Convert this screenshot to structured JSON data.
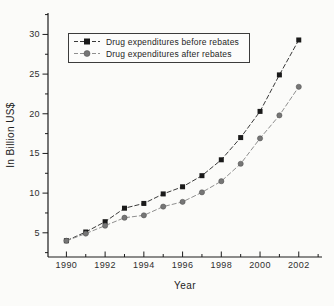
{
  "figure": {
    "background_color": "#fbfbf9",
    "axis_color": "#1c1c1c",
    "text_color": "#2e2e2e"
  },
  "chart_data": {
    "type": "line",
    "title": "",
    "xlabel": "Year",
    "ylabel": "In Billion US$",
    "x": [
      1990,
      1991,
      1992,
      1993,
      1994,
      1995,
      1996,
      1997,
      1998,
      1999,
      2000,
      2001,
      2002
    ],
    "series": [
      {
        "name": "Drug expenditures before rebates",
        "marker": "square",
        "marker_color": "#1a1a1a",
        "line_color": "#3a3a3a",
        "values": [
          4.0,
          5.1,
          6.4,
          8.1,
          8.7,
          9.9,
          10.8,
          12.2,
          14.2,
          17.0,
          20.3,
          24.9,
          29.3
        ]
      },
      {
        "name": "Drug expenditures after rebates",
        "marker": "circle",
        "marker_color": "#767676",
        "line_color": "#8f8f8f",
        "values": [
          4.0,
          4.9,
          5.9,
          6.9,
          7.2,
          8.3,
          8.9,
          10.1,
          11.5,
          13.7,
          16.9,
          19.8,
          23.4
        ]
      }
    ],
    "xlim": [
      1989.05,
      2003.2
    ],
    "ylim": [
      1.95,
      32.7
    ],
    "x_major_ticks": [
      1990,
      1992,
      1994,
      1996,
      1998,
      2000,
      2002
    ],
    "x_minor_ticks": [
      1991,
      1993,
      1995,
      1997,
      1999,
      2001,
      2003
    ],
    "y_major_ticks": [
      5,
      10,
      15,
      20,
      25,
      30
    ],
    "y_minor_ticks": [
      2.5,
      7.5,
      12.5,
      17.5,
      22.5,
      27.5,
      32.5
    ],
    "line_style": "dashed",
    "grid": false,
    "legend_position": "top-left-inside"
  }
}
